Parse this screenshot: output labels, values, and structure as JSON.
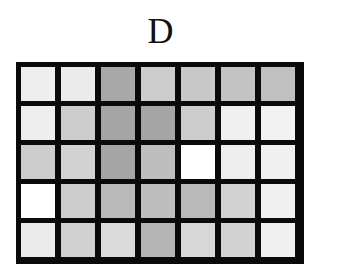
{
  "title": "D",
  "grid": {
    "rows": 5,
    "cols": 7,
    "border_color": "#0a0a0a",
    "cells": [
      [
        "#eeeeee",
        "#ebebeb",
        "#a8a8a8",
        "#cdcdcd",
        "#c8c8c8",
        "#c3c3c3",
        "#c0c0c0"
      ],
      [
        "#eeeeee",
        "#cdcdcd",
        "#a5a5a5",
        "#a5a5a5",
        "#cdcdcd",
        "#f0f0f0",
        "#f2f2f2"
      ],
      [
        "#cdcdcd",
        "#d2d2d2",
        "#a5a5a5",
        "#bebebe",
        "#ffffff",
        "#eeeeee",
        "#f0f0f0"
      ],
      [
        "#ffffff",
        "#cdcdcd",
        "#b9b9b9",
        "#bebebe",
        "#b9b9b9",
        "#d2d2d2",
        "#f0f0f0"
      ],
      [
        "#ebebeb",
        "#d0d0d0",
        "#dadada",
        "#b4b4b4",
        "#d7d7d7",
        "#d2d2d2",
        "#f0f0f0"
      ]
    ]
  },
  "chart_data": {
    "type": "heatmap",
    "title": "D",
    "rows": 5,
    "cols": 7,
    "values_gray_0_255": [
      [
        238,
        235,
        168,
        205,
        200,
        195,
        192
      ],
      [
        238,
        205,
        165,
        165,
        205,
        240,
        242
      ],
      [
        205,
        210,
        165,
        190,
        255,
        238,
        240
      ],
      [
        255,
        205,
        185,
        190,
        185,
        210,
        240
      ],
      [
        235,
        208,
        218,
        180,
        215,
        210,
        240
      ]
    ],
    "xlabel": "",
    "ylabel": "",
    "grid": true,
    "legend": null
  }
}
